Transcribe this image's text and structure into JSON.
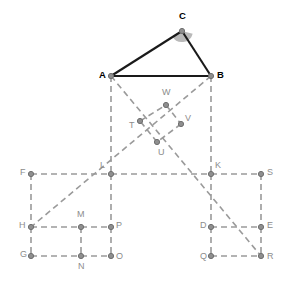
{
  "figure": {
    "width": 287,
    "height": 282,
    "background_color": "#ffffff"
  },
  "style": {
    "solid_stroke_color": "#1a1a1a",
    "dashed_stroke_color": "#9a9a9a",
    "point_fill_color": "#8f8f8f",
    "point_stroke_color": "#6e6e6e",
    "angle_arc_fill": "#b9b9b9",
    "label_color": "#8c8c8c",
    "primary_label_color": "#000000",
    "solid_stroke_width": 2.1,
    "dashed_stroke_width": 1.6,
    "dash_pattern": "6 4",
    "point_radius": 2.6
  },
  "chart_data": {
    "type": "diagram",
    "points": [
      {
        "label": "C",
        "x": 182,
        "y": 31,
        "label_dx": -3,
        "label_dy": -15,
        "emphasis": "primary"
      },
      {
        "label": "A",
        "x": 111,
        "y": 76,
        "label_dx": -12,
        "label_dy": -1,
        "emphasis": "primary"
      },
      {
        "label": "B",
        "x": 211,
        "y": 76,
        "label_dx": 6,
        "label_dy": -1,
        "emphasis": "primary"
      },
      {
        "label": "W",
        "x": 166,
        "y": 105,
        "label_dx": -4,
        "label_dy": -12,
        "emphasis": "normal"
      },
      {
        "label": "T",
        "x": 140,
        "y": 121,
        "label_dx": -11,
        "label_dy": 5,
        "emphasis": "normal"
      },
      {
        "label": "V",
        "x": 181,
        "y": 124,
        "label_dx": 4,
        "label_dy": -5,
        "emphasis": "normal"
      },
      {
        "label": "U",
        "x": 157,
        "y": 142,
        "label_dx": 1,
        "label_dy": 11,
        "emphasis": "normal"
      },
      {
        "label": "F",
        "x": 31,
        "y": 174,
        "label_dx": -11,
        "label_dy": -1,
        "emphasis": "normal"
      },
      {
        "label": "L",
        "x": 111,
        "y": 174,
        "label_dx": -11,
        "label_dy": -8,
        "emphasis": "normal"
      },
      {
        "label": "K",
        "x": 211,
        "y": 174,
        "label_dx": 4,
        "label_dy": -8,
        "emphasis": "normal"
      },
      {
        "label": "S",
        "x": 261,
        "y": 174,
        "label_dx": 6,
        "label_dy": -1,
        "emphasis": "normal"
      },
      {
        "label": "H",
        "x": 31,
        "y": 227,
        "label_dx": -12,
        "label_dy": -1,
        "emphasis": "normal"
      },
      {
        "label": "M",
        "x": 81,
        "y": 227,
        "label_dx": -4,
        "label_dy": -12,
        "emphasis": "normal"
      },
      {
        "label": "P",
        "x": 111,
        "y": 227,
        "label_dx": 5,
        "label_dy": -1,
        "emphasis": "normal"
      },
      {
        "label": "D",
        "x": 211,
        "y": 227,
        "label_dx": -11,
        "label_dy": -1,
        "emphasis": "normal"
      },
      {
        "label": "E",
        "x": 261,
        "y": 227,
        "label_dx": 6,
        "label_dy": -1,
        "emphasis": "normal"
      },
      {
        "label": "G",
        "x": 31,
        "y": 256,
        "label_dx": -11,
        "label_dy": -1,
        "emphasis": "normal"
      },
      {
        "label": "N",
        "x": 81,
        "y": 256,
        "label_dx": -3,
        "label_dy": 11,
        "emphasis": "normal"
      },
      {
        "label": "O",
        "x": 111,
        "y": 256,
        "label_dx": 5,
        "label_dy": 1,
        "emphasis": "normal"
      },
      {
        "label": "Q",
        "x": 211,
        "y": 256,
        "label_dx": -11,
        "label_dy": 1,
        "emphasis": "normal"
      },
      {
        "label": "R",
        "x": 261,
        "y": 256,
        "label_dx": 6,
        "label_dy": 1,
        "emphasis": "normal"
      }
    ],
    "solid_segments": [
      {
        "name": "side-AC",
        "from": "A",
        "to": "C"
      },
      {
        "name": "side-CB",
        "from": "C",
        "to": "B"
      },
      {
        "name": "side-AB",
        "from": "A",
        "to": "B"
      }
    ],
    "dashed_segments": [
      {
        "name": "segment-A-L",
        "from": "A",
        "to": "L"
      },
      {
        "name": "segment-B-K",
        "from": "B",
        "to": "K"
      },
      {
        "name": "diagonal-A-R",
        "from": "A",
        "to": "R"
      },
      {
        "name": "diagonal-B-H",
        "from": "B",
        "to": "H"
      },
      {
        "name": "square-T-W",
        "from": "T",
        "to": "W"
      },
      {
        "name": "square-W-V",
        "from": "W",
        "to": "V"
      },
      {
        "name": "square-V-U",
        "from": "V",
        "to": "U"
      },
      {
        "name": "square-U-T",
        "from": "U",
        "to": "T"
      },
      {
        "name": "edge-F-L",
        "from": "F",
        "to": "L"
      },
      {
        "name": "edge-L-K",
        "from": "L",
        "to": "K"
      },
      {
        "name": "edge-K-S",
        "from": "K",
        "to": "S"
      },
      {
        "name": "edge-F-H",
        "from": "F",
        "to": "H"
      },
      {
        "name": "edge-H-P",
        "from": "H",
        "to": "P"
      },
      {
        "name": "edge-L-P",
        "from": "L",
        "to": "P"
      },
      {
        "name": "edge-H-G",
        "from": "H",
        "to": "G"
      },
      {
        "name": "edge-G-O",
        "from": "G",
        "to": "O"
      },
      {
        "name": "edge-P-O",
        "from": "P",
        "to": "O"
      },
      {
        "name": "edge-M-N",
        "from": "M",
        "to": "N"
      },
      {
        "name": "edge-S-E",
        "from": "S",
        "to": "E"
      },
      {
        "name": "edge-K-D",
        "from": "K",
        "to": "D"
      },
      {
        "name": "edge-D-E",
        "from": "D",
        "to": "E"
      },
      {
        "name": "edge-D-Q",
        "from": "D",
        "to": "Q"
      },
      {
        "name": "edge-Q-R",
        "from": "Q",
        "to": "R"
      },
      {
        "name": "edge-E-R",
        "from": "E",
        "to": "R"
      }
    ],
    "angle_marker": {
      "name": "angle-at-C",
      "vertex": "C",
      "radius": 11,
      "start_deg": 14,
      "end_deg": 152
    }
  }
}
